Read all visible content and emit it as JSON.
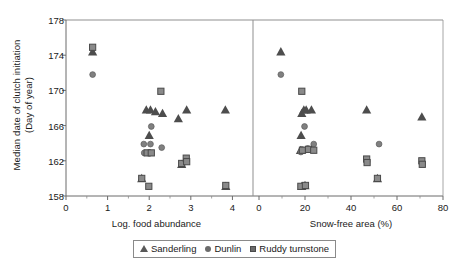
{
  "chart_data": {
    "type": "scatter",
    "title": "",
    "ylabel": "Median date of clutch initiation (Day of year)",
    "ylabel_line1": "Median date of clutch initiation",
    "ylabel_line2": "(Day of year)",
    "ylim": [
      158,
      178
    ],
    "yticks": [
      158,
      162,
      166,
      170,
      174,
      178
    ],
    "grid": false,
    "legend_position": "bottom-center",
    "legend": [
      {
        "name": "Sanderling",
        "marker": "triangle",
        "color": "#4d4d4d"
      },
      {
        "name": "Dunlin",
        "marker": "circle",
        "color": "#808080"
      },
      {
        "name": "Ruddy turnstone",
        "marker": "square",
        "color": "#8a8a8a"
      }
    ],
    "panels": [
      {
        "id": "left",
        "xlabel": "Log. food abundance",
        "xlim": [
          0,
          4.35
        ],
        "xticks": [
          0,
          1,
          2,
          3,
          4
        ],
        "series": [
          {
            "name": "Sanderling",
            "marker": "triangle",
            "points": [
              [
                0.64,
                174.4
              ],
              [
                1.93,
                167.8
              ],
              [
                2.03,
                167.8
              ],
              [
                2.15,
                167.6
              ],
              [
                2.0,
                164.9
              ],
              [
                2.32,
                167.4
              ],
              [
                2.7,
                166.8
              ],
              [
                2.9,
                167.8
              ],
              [
                3.83,
                167.8
              ],
              [
                3.84,
                159.1
              ],
              [
                1.82,
                160.0
              ],
              [
                2.78,
                161.6
              ]
            ]
          },
          {
            "name": "Dunlin",
            "marker": "circle",
            "points": [
              [
                0.64,
                171.8
              ],
              [
                2.05,
                165.9
              ],
              [
                1.87,
                163.9
              ],
              [
                2.03,
                163.9
              ],
              [
                2.3,
                163.5
              ],
              [
                1.88,
                162.9
              ],
              [
                2.01,
                162.9
              ]
            ]
          },
          {
            "name": "Ruddy turnstone",
            "marker": "square",
            "points": [
              [
                0.64,
                174.9
              ],
              [
                2.28,
                169.9
              ],
              [
                1.95,
                162.9
              ],
              [
                2.05,
                162.9
              ],
              [
                1.82,
                160.0
              ],
              [
                1.99,
                159.1
              ],
              [
                2.78,
                161.7
              ],
              [
                2.89,
                162.3
              ],
              [
                2.9,
                161.9
              ],
              [
                3.84,
                159.2
              ]
            ]
          }
        ]
      },
      {
        "id": "right",
        "xlabel": "Snow-free area (%)",
        "xlim": [
          0,
          80
        ],
        "xticks": [
          0,
          20,
          40,
          60,
          80
        ],
        "series": [
          {
            "name": "Sanderling",
            "marker": "triangle",
            "points": [
              [
                9.5,
                174.4
              ],
              [
                18.6,
                167.4
              ],
              [
                19.5,
                167.8
              ],
              [
                20.5,
                167.8
              ],
              [
                22.8,
                167.8
              ],
              [
                18.3,
                164.9
              ],
              [
                18.0,
                163.2
              ],
              [
                46.8,
                167.8
              ],
              [
                70.8,
                167.0
              ],
              [
                51.5,
                160.0
              ],
              [
                18.6,
                159.1
              ],
              [
                20.0,
                159.2
              ]
            ]
          },
          {
            "name": "Dunlin",
            "marker": "circle",
            "points": [
              [
                9.5,
                171.8
              ],
              [
                19.8,
                165.9
              ],
              [
                18.6,
                163.3
              ],
              [
                23.8,
                163.9
              ],
              [
                52.2,
                163.9
              ],
              [
                18.2,
                163.0
              ],
              [
                21.2,
                163.4
              ]
            ]
          },
          {
            "name": "Ruddy turnstone",
            "marker": "square",
            "points": [
              [
                18.6,
                169.9
              ],
              [
                18.9,
                163.2
              ],
              [
                21.5,
                163.3
              ],
              [
                23.8,
                163.2
              ],
              [
                18.2,
                159.1
              ],
              [
                20.2,
                159.2
              ],
              [
                46.8,
                162.2
              ],
              [
                47.0,
                161.8
              ],
              [
                51.5,
                160.0
              ],
              [
                70.8,
                162.0
              ],
              [
                71.0,
                161.6
              ]
            ]
          }
        ]
      }
    ]
  }
}
